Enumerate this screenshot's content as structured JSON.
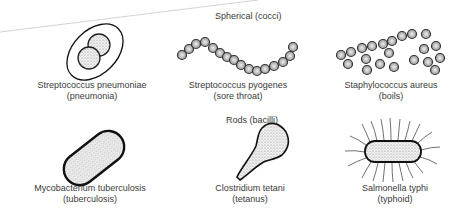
{
  "sections": {
    "spherical": "Spherical (cocci)",
    "rods": "Rods (bacilli)"
  },
  "organisms": [
    {
      "name": "Streptococcus pneumoniae",
      "disease": "(pneumonia)"
    },
    {
      "name": "Streptococcus pyogenes",
      "disease": "(sore throat)"
    },
    {
      "name": "Staphylococcus aureus",
      "disease": "(boils)"
    },
    {
      "name": "Mycobacterium tuberculosis",
      "disease": "(tuberculosis)"
    },
    {
      "name": "Clostridium tetani",
      "disease": "(tetanus)"
    },
    {
      "name": "Salmonella typhi",
      "disease": "(typhoid)"
    }
  ]
}
